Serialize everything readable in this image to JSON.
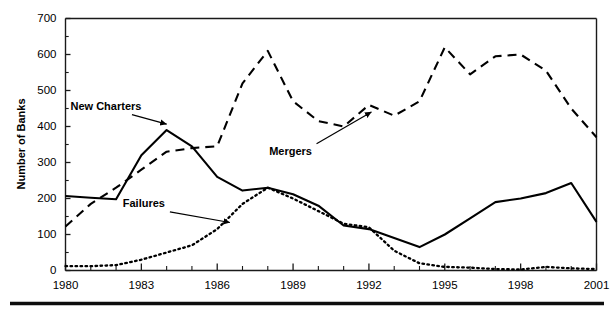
{
  "chart_data": {
    "type": "line",
    "title": "",
    "subtitle": "",
    "xlabel": "",
    "ylabel": "Number of Banks",
    "xlim": [
      1980,
      2001
    ],
    "ylim": [
      0,
      700
    ],
    "yticks": [
      0,
      100,
      200,
      300,
      400,
      500,
      600,
      700
    ],
    "ytick_labels": [
      "0",
      "100",
      "200",
      "300",
      "400",
      "500",
      "600",
      "700"
    ],
    "y_minor_tick_interval": 50,
    "xticks": [
      1980,
      1981,
      1982,
      1983,
      1984,
      1985,
      1986,
      1987,
      1988,
      1989,
      1990,
      1991,
      1992,
      1993,
      1994,
      1995,
      1996,
      1997,
      1998,
      1999,
      2000,
      2001
    ],
    "xtick_labels_shown": [
      "1980",
      "1983",
      "1986",
      "1989",
      "1992",
      "1995",
      "1998",
      "2001"
    ],
    "xtick_label_years": [
      1980,
      1983,
      1986,
      1989,
      1992,
      1995,
      1998,
      2001
    ],
    "grid": false,
    "legend_position": "inline-annotations",
    "x": [
      1980,
      1981,
      1982,
      1983,
      1984,
      1985,
      1986,
      1987,
      1988,
      1989,
      1990,
      1991,
      1992,
      1993,
      1994,
      1995,
      1996,
      1997,
      1998,
      1999,
      2000,
      2001
    ],
    "series": [
      {
        "name": "New Charters",
        "style": "solid",
        "color": "#000000",
        "values": [
          207,
          202,
          198,
          320,
          390,
          345,
          260,
          222,
          230,
          212,
          180,
          125,
          115,
          90,
          65,
          100,
          145,
          190,
          200,
          215,
          243,
          135
        ]
      },
      {
        "name": "Mergers",
        "style": "dashed",
        "color": "#000000",
        "values": [
          122,
          185,
          230,
          280,
          330,
          340,
          345,
          520,
          610,
          470,
          415,
          400,
          460,
          430,
          470,
          620,
          545,
          595,
          600,
          555,
          450,
          370
        ]
      },
      {
        "name": "Failures",
        "style": "dotted",
        "color": "#000000",
        "values": [
          12,
          12,
          15,
          30,
          50,
          70,
          115,
          185,
          230,
          200,
          165,
          130,
          120,
          55,
          20,
          10,
          8,
          4,
          3,
          10,
          6,
          4
        ]
      }
    ],
    "annotations": [
      {
        "text": "New Charters",
        "series": "New Charters",
        "x": 1981.6,
        "y": 455
      },
      {
        "text": "Mergers",
        "series": "Mergers",
        "x": 1988.9,
        "y": 330
      },
      {
        "text": "Failures",
        "series": "Failures",
        "x": 1983.1,
        "y": 185
      }
    ]
  },
  "axis": {
    "y_title": "Number of Banks",
    "y_labels": [
      "700",
      "600",
      "500",
      "400",
      "300",
      "200",
      "100",
      "0"
    ],
    "x_labels": [
      "1980",
      "1983",
      "1986",
      "1989",
      "1992",
      "1995",
      "1998",
      "2001"
    ]
  },
  "annotations": {
    "new_charters": "New Charters",
    "mergers": "Mergers",
    "failures": "Failures"
  },
  "colors": {
    "ink": "#000000",
    "background": "#ffffff",
    "axis": "#1a1a1a"
  }
}
